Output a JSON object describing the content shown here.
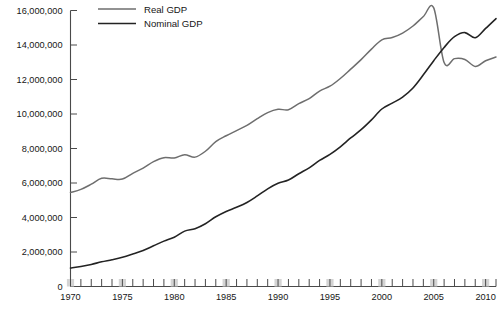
{
  "chart_data": {
    "type": "line",
    "title": "",
    "subtitle": "",
    "xlabel": "",
    "ylabel": "",
    "xlim": [
      1970,
      2011
    ],
    "ylim": [
      0,
      16000000
    ],
    "grid": false,
    "legend_position": "top-left-inside",
    "y_ticks": [
      0,
      2000000,
      4000000,
      6000000,
      8000000,
      10000000,
      12000000,
      14000000,
      16000000
    ],
    "y_tick_labels": [
      "0",
      "2,000,000",
      "4,000,000",
      "6,000,000",
      "8,000,000",
      "10,000,000",
      "12,000,000",
      "14,000,000",
      "16,000,000"
    ],
    "x_ticks": [
      1970,
      1975,
      1980,
      1985,
      1990,
      1995,
      2000,
      2005,
      2010
    ],
    "x_tick_labels": [
      "1970",
      "1975",
      "1980",
      "1985",
      "1990",
      "1995",
      "2000",
      "2005",
      "2010"
    ],
    "x_minor_tick_step": 1,
    "x": [
      1970,
      1971,
      1972,
      1973,
      1974,
      1975,
      1976,
      1977,
      1978,
      1979,
      1980,
      1981,
      1982,
      1983,
      1984,
      1985,
      1986,
      1987,
      1988,
      1989,
      1990,
      1991,
      1992,
      1993,
      1994,
      1995,
      1996,
      1997,
      1998,
      1999,
      2000,
      2001,
      2002,
      2003,
      2004,
      2005,
      2006,
      2007,
      2008,
      2009,
      2010,
      2011
    ],
    "series": [
      {
        "name": "Real GDP",
        "color": "#6e6e6e",
        "stroke_width": 1.5,
        "values": [
          5450000,
          5630000,
          5930000,
          6270000,
          6240000,
          6230000,
          6560000,
          6860000,
          7240000,
          7470000,
          7450000,
          7640000,
          7500000,
          7840000,
          8400000,
          8740000,
          9040000,
          9340000,
          9730000,
          10080000,
          10270000,
          10250000,
          10600000,
          10890000,
          11330000,
          11610000,
          12060000,
          12600000,
          13150000,
          13760000,
          14300000,
          14430000,
          14690000,
          15100000,
          15650000,
          16150000,
          12980000,
          13210000,
          13160000,
          12760000,
          13090000,
          13300000
        ]
      },
      {
        "name": "Nominal GDP",
        "color": "#232323",
        "stroke_width": 1.6,
        "values": [
          1070000,
          1160000,
          1280000,
          1430000,
          1550000,
          1690000,
          1880000,
          2090000,
          2360000,
          2630000,
          2860000,
          3210000,
          3350000,
          3640000,
          4040000,
          4350000,
          4590000,
          4870000,
          5250000,
          5660000,
          5980000,
          6170000,
          6540000,
          6880000,
          7310000,
          7660000,
          8100000,
          8610000,
          9090000,
          9660000,
          10290000,
          10630000,
          10980000,
          11510000,
          12270000,
          13090000,
          13860000,
          14480000,
          14720000,
          14420000,
          14960000,
          15530000
        ]
      }
    ]
  },
  "legend": {
    "items": [
      {
        "label": "Real GDP",
        "swatch_color": "#6e6e6e"
      },
      {
        "label": "Nominal GDP",
        "swatch_color": "#232323"
      }
    ]
  },
  "axes": {
    "y_axis_name": "y-axis",
    "x_axis_name": "x-axis"
  }
}
